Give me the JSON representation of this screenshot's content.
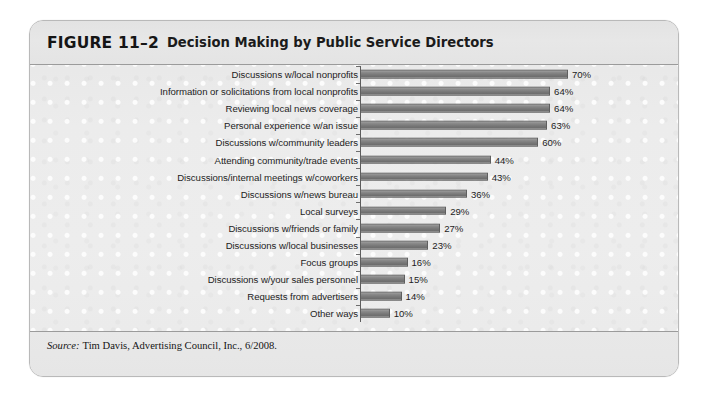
{
  "figure": {
    "number": "FIGURE 11–2",
    "title": "Decision Making by Public Service Directors",
    "source_label": "Source:",
    "source_text": "Tim Davis, Advertising Council, Inc., 6/2008."
  },
  "chart_data": {
    "type": "bar",
    "orientation": "horizontal",
    "title": "Decision Making by Public Service Directors",
    "xlabel": "",
    "ylabel": "",
    "xlim": [
      0,
      70
    ],
    "grid": false,
    "legend": null,
    "value_suffix": "%",
    "bar_color": "#7b7b7b",
    "bar_border_color": "#5f5f5f",
    "axis_color": "#5d5d5d",
    "categories": [
      "Discussions w/local nonprofits",
      "Information or solicitations from local nonprofits",
      "Reviewing local news coverage",
      "Personal experience w/an issue",
      "Discussions w/community leaders",
      "Attending community/trade events",
      "Discussions/internal meetings w/coworkers",
      "Discussions w/news bureau",
      "Local surveys",
      "Discussions w/friends or family",
      "Discussions w/local businesses",
      "Focus groups",
      "Discussions w/your sales personnel",
      "Requests from advertisers",
      "Other ways"
    ],
    "values": [
      70,
      64,
      64,
      63,
      60,
      44,
      43,
      36,
      29,
      27,
      23,
      16,
      15,
      14,
      10
    ],
    "value_labels": [
      "70%",
      "64%",
      "64%",
      "63%",
      "60%",
      "44%",
      "43%",
      "36%",
      "29%",
      "27%",
      "23%",
      "16%",
      "15%",
      "14%",
      "10%"
    ]
  }
}
